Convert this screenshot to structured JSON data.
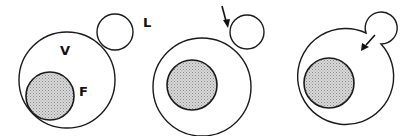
{
  "figure": {
    "title": "",
    "panels": [
      {
        "id": "panel-1",
        "stage": "separate",
        "labels": {
          "vesicle": "V",
          "food": "F",
          "lysosome": "L"
        },
        "arrow": false
      },
      {
        "id": "panel-2",
        "stage": "contact",
        "labels": {},
        "arrow": true
      },
      {
        "id": "panel-3",
        "stage": "fused",
        "labels": {},
        "arrow": true
      }
    ],
    "colors": {
      "stroke": "#1a1a1a",
      "shading": "#bdbdbd"
    }
  }
}
